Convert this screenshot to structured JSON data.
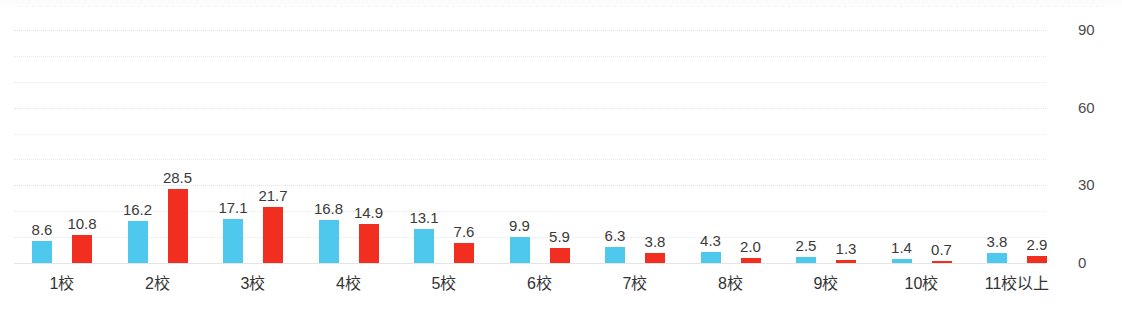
{
  "chart_data": {
    "type": "bar",
    "title": "",
    "subtitle": "",
    "xlabel": "",
    "ylabel": "",
    "ylim": [
      0,
      90
    ],
    "yticks": [
      0,
      30,
      60,
      90
    ],
    "ytick_labels": [
      "0",
      "30",
      "60",
      "90"
    ],
    "gridline_interval": 10,
    "grid": true,
    "grid_style": "dotted",
    "y_axis_position": "right",
    "legend": "none",
    "data_labels": true,
    "data_label_format": "one-decimal",
    "categories": [
      "1校",
      "2校",
      "3校",
      "4校",
      "5校",
      "6校",
      "7校",
      "8校",
      "9校",
      "10校",
      "11校以上"
    ],
    "series": [
      {
        "name": "series-1",
        "color": "#4FC8EE",
        "values": [
          8.6,
          16.2,
          17.1,
          16.8,
          13.1,
          9.9,
          6.3,
          4.3,
          2.5,
          1.4,
          3.8
        ],
        "labels": [
          "8.6",
          "16.2",
          "17.1",
          "16.8",
          "13.1",
          "9.9",
          "6.3",
          "4.3",
          "2.5",
          "1.4",
          "3.8"
        ]
      },
      {
        "name": "series-2",
        "color": "#F22E20",
        "values": [
          10.8,
          28.5,
          21.7,
          14.9,
          7.6,
          5.9,
          3.8,
          2.0,
          1.3,
          0.7,
          2.9
        ],
        "labels": [
          "10.8",
          "28.5",
          "21.7",
          "14.9",
          "7.6",
          "5.9",
          "3.8",
          "2.0",
          "1.3",
          "0.7",
          "2.9"
        ]
      }
    ]
  },
  "colors": {
    "series_1": "#4FC8EE",
    "series_2": "#F22E20",
    "gridline": "#e8eaee",
    "axis_line": "#e3e4e6",
    "data_label_text": "#3a3a3a",
    "category_label_text": "#333333",
    "y_tick_text": "#4c4c4c",
    "background": "#ffffff"
  }
}
